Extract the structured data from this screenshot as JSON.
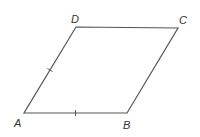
{
  "diagram": {
    "type": "parallelogram",
    "stroke_color": "#555555",
    "label_color": "#333333",
    "vertices": [
      {
        "name": "A",
        "x": 24,
        "y": 113,
        "label_x": 14,
        "label_y": 127
      },
      {
        "name": "B",
        "x": 127,
        "y": 113,
        "label_x": 123,
        "label_y": 129
      },
      {
        "name": "C",
        "x": 178,
        "y": 28,
        "label_x": 179,
        "label_y": 24
      },
      {
        "name": "D",
        "x": 76,
        "y": 27,
        "label_x": 71,
        "label_y": 23
      }
    ],
    "tick_marks": [
      {
        "side": "AD",
        "count": 1
      },
      {
        "side": "AB",
        "count": 1
      }
    ]
  }
}
